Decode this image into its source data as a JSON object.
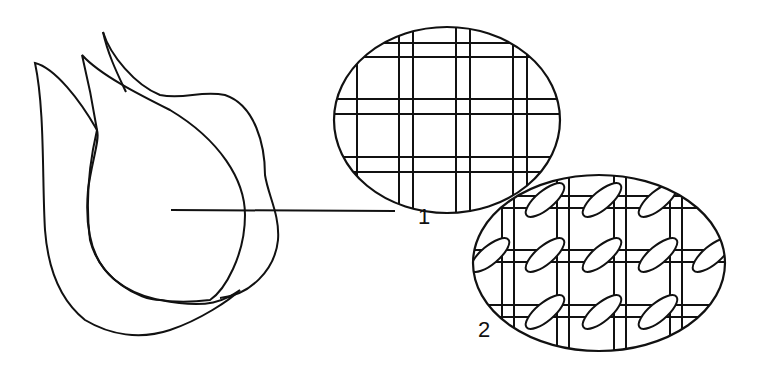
{
  "diagram": {
    "stroke_color": "#111111",
    "background": "#ffffff",
    "labels": [
      {
        "id": "1",
        "text": "1",
        "target": "plain grid weave (upper oval)"
      },
      {
        "id": "2",
        "text": "2",
        "target": "interlaced weave (lower oval)"
      }
    ]
  }
}
